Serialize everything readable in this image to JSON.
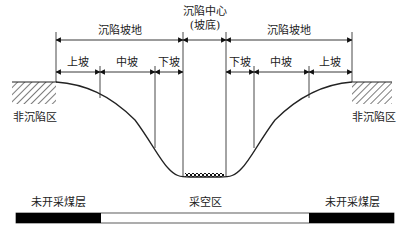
{
  "diagram": {
    "type": "mining subsidence basin cross-section",
    "center_label": "沉陷中心",
    "center_sublabel": "(坡底)",
    "left_zone": {
      "label": "沉陷坡地",
      "segments": [
        "上坡",
        "中坡",
        "下坡"
      ]
    },
    "right_zone": {
      "label": "沉陷坡地",
      "segments": [
        "下坡",
        "中坡",
        "上坡"
      ]
    },
    "outer_left_label": "非沉陷区",
    "outer_right_label": "非沉陷区",
    "seam": {
      "left_label": "未开采煤层",
      "middle_label": "采空区",
      "right_label": "未开采煤层"
    },
    "colors": {
      "line": "#222222",
      "seam_unmined": "#000000",
      "goaf": "#ffffff"
    }
  }
}
